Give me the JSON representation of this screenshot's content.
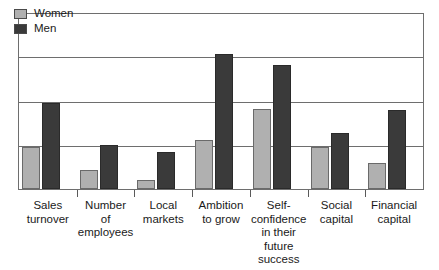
{
  "chart_data": {
    "type": "bar",
    "title": "",
    "subtitle": "",
    "xlabel": "",
    "ylabel": "",
    "ylim": [
      0,
      100
    ],
    "grid": true,
    "gridline_values": [
      25,
      50,
      75,
      100
    ],
    "axis_tick_labels": [],
    "legend_position": "top-left",
    "categories": [
      "Sales\nturnover",
      "Number\nof\nemployees",
      "Local\nmarkets",
      "Ambition\nto grow",
      "Self-\nconfidence\nin their\nfuture\nsuccess",
      "Social\ncapital",
      "Financial\ncapital"
    ],
    "series": [
      {
        "name": "Women",
        "color": "#b0b0b0",
        "values": [
          24,
          11,
          5,
          28,
          46,
          24,
          15
        ]
      },
      {
        "name": "Men",
        "color": "#3a3a3a",
        "values": [
          49,
          25,
          21,
          77,
          71,
          32,
          45
        ]
      }
    ]
  },
  "legend": {
    "items": [
      {
        "label": "Women",
        "swatch": "legend-swatch-women"
      },
      {
        "label": "Men",
        "swatch": "legend-swatch-men"
      }
    ]
  },
  "colors": {
    "women": "#b0b0b0",
    "men": "#3a3a3a",
    "frame": "#6e6e6e",
    "background": "#ffffff"
  }
}
